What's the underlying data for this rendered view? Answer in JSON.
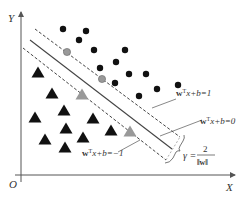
{
  "axes": {
    "x_label": "X",
    "y_label": "Y",
    "origin_label": "O"
  },
  "lines": {
    "upper_margin": {
      "label_prefix": "w",
      "label_suffix": "x+b=1",
      "sup": "T",
      "style": "dashed"
    },
    "hyperplane": {
      "label_prefix": "w",
      "label_suffix": "x+b=0",
      "sup": "T",
      "style": "solid"
    },
    "lower_margin": {
      "label_prefix": "w",
      "label_suffix": "x+b=−1",
      "sup": "T",
      "style": "dashed"
    }
  },
  "margin": {
    "symbol": "γ =",
    "numerator": "2",
    "denominator": "‖w‖"
  },
  "colors": {
    "point": "#111111",
    "support_vector": "#999999",
    "line": "#444444",
    "axis": "#555555"
  },
  "classes": {
    "positive": {
      "shape": "circle",
      "points": [
        [
          63,
          29
        ],
        [
          86,
          31
        ],
        [
          79,
          40
        ],
        [
          94,
          50
        ],
        [
          125,
          50
        ],
        [
          100,
          68
        ],
        [
          116,
          62
        ],
        [
          129,
          74
        ],
        [
          146,
          74
        ],
        [
          115,
          83
        ],
        [
          157,
          89
        ],
        [
          139,
          96
        ],
        [
          178,
          85
        ]
      ],
      "support_vectors": [
        [
          67,
          52
        ],
        [
          102,
          79
        ]
      ]
    },
    "negative": {
      "shape": "triangle",
      "points": [
        [
          38,
          73
        ],
        [
          52,
          94
        ],
        [
          64,
          111
        ],
        [
          35,
          118
        ],
        [
          93,
          119
        ],
        [
          66,
          129
        ],
        [
          45,
          140
        ],
        [
          83,
          138
        ],
        [
          111,
          131
        ],
        [
          65,
          148
        ]
      ],
      "support_vectors": [
        [
          82,
          95
        ],
        [
          130,
          132
        ]
      ]
    }
  }
}
